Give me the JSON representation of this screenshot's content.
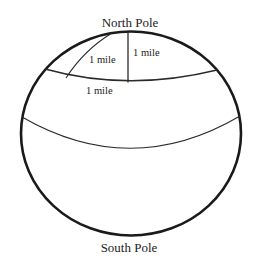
{
  "diagram": {
    "labels": {
      "north_pole": "North Pole",
      "south_pole": "South Pole",
      "meridian_curved": "1 mile",
      "meridian_straight": "1 mile",
      "latitude_circle": "1 mile"
    },
    "colors": {
      "outline": "#1a1a1a",
      "lines": "#2a2a2a",
      "text": "#222222",
      "background": "#ffffff"
    }
  }
}
